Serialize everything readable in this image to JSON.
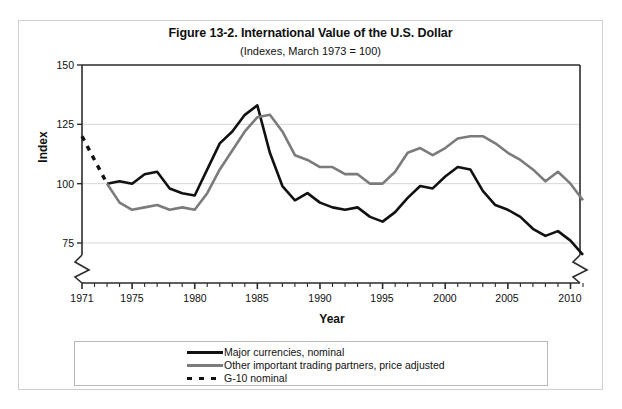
{
  "figure": {
    "title": "Figure 13-2. International Value of the U.S. Dollar",
    "subtitle": "(Indexes, March 1973 = 100)"
  },
  "axes": {
    "ylabel": "Index",
    "xlabel": "Year",
    "y_ticks": [
      "150",
      "125",
      "100",
      "75"
    ],
    "x_ticks": [
      "1971",
      "1975",
      "1980",
      "1985",
      "1990",
      "1995",
      "2000",
      "2005",
      "2010"
    ]
  },
  "legend": {
    "items": [
      {
        "label": "Major currencies, nominal",
        "style": "solid",
        "color": "#111111"
      },
      {
        "label": "Other important trading partners, price adjusted",
        "style": "solid",
        "color": "#7b7b7b"
      },
      {
        "label": "G-10 nominal",
        "style": "dashed",
        "color": "#111111"
      }
    ]
  },
  "colors": {
    "major_currencies": "#111111",
    "other_partners": "#7b7b7b",
    "g10": "#111111",
    "grid": "#d6d6d6",
    "axis": "#2b2b2b",
    "outer_border": "#cfcfcf"
  },
  "chart_data": {
    "type": "line",
    "title": "Figure 13-2. International Value of the U.S. Dollar",
    "subtitle": "(Indexes, March 1973 = 100)",
    "xlabel": "Year",
    "ylabel": "Index",
    "xlim": [
      1971,
      2011
    ],
    "ylim": [
      68,
      150
    ],
    "y_axis_break": true,
    "y_axis_break_below": 75,
    "grid": "horizontal",
    "legend_position": "below-plot",
    "x_tick_interval": 1,
    "x_labeled_ticks": [
      1971,
      1975,
      1980,
      1985,
      1990,
      1995,
      2000,
      2005,
      2010
    ],
    "y_ticks": [
      75,
      100,
      125,
      150
    ],
    "series": [
      {
        "name": "G-10 nominal",
        "style": "dashed",
        "color": "#111111",
        "x": [
          1971,
          1972,
          1973
        ],
        "values": [
          120,
          110,
          100
        ]
      },
      {
        "name": "Major currencies, nominal",
        "style": "solid",
        "color": "#111111",
        "x": [
          1973,
          1974,
          1975,
          1976,
          1977,
          1978,
          1979,
          1980,
          1981,
          1982,
          1983,
          1984,
          1985,
          1986,
          1987,
          1988,
          1989,
          1990,
          1991,
          1992,
          1993,
          1994,
          1995,
          1996,
          1997,
          1998,
          1999,
          2000,
          2001,
          2002,
          2003,
          2004,
          2005,
          2006,
          2007,
          2008,
          2009,
          2010,
          2011
        ],
        "values": [
          100,
          101,
          100,
          104,
          105,
          98,
          96,
          95,
          106,
          117,
          122,
          129,
          133,
          113,
          99,
          93,
          96,
          92,
          90,
          89,
          90,
          86,
          84,
          88,
          94,
          99,
          98,
          103,
          107,
          106,
          97,
          91,
          89,
          86,
          81,
          78,
          80,
          76,
          70
        ]
      },
      {
        "name": "Other important trading partners, price adjusted",
        "style": "solid",
        "color": "#7b7b7b",
        "x": [
          1973,
          1974,
          1975,
          1976,
          1977,
          1978,
          1979,
          1980,
          1981,
          1982,
          1983,
          1984,
          1985,
          1986,
          1987,
          1988,
          1989,
          1990,
          1991,
          1992,
          1993,
          1994,
          1995,
          1996,
          1997,
          1998,
          1999,
          2000,
          2001,
          2002,
          2003,
          2004,
          2005,
          2006,
          2007,
          2008,
          2009,
          2010,
          2011
        ],
        "values": [
          100,
          92,
          89,
          90,
          91,
          89,
          90,
          89,
          96,
          106,
          114,
          122,
          128,
          129,
          122,
          112,
          110,
          107,
          107,
          104,
          104,
          100,
          100,
          105,
          113,
          115,
          112,
          115,
          119,
          120,
          120,
          117,
          113,
          110,
          106,
          101,
          105,
          100,
          93
        ]
      }
    ]
  }
}
